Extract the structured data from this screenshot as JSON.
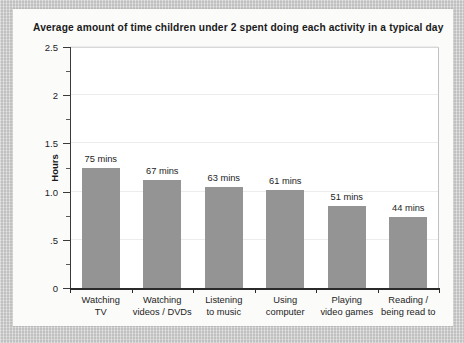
{
  "chart_data": {
    "type": "bar",
    "title": "Average amount of time children under 2 spent doing each activity in a typical day",
    "xlabel": "",
    "ylabel": "Hours",
    "categories": [
      "Watching TV",
      "Watching videos / DVDs",
      "Listening to music",
      "Using computer",
      "Playing video games",
      "Reading / being read to"
    ],
    "category_lines": [
      [
        "Watching",
        "TV"
      ],
      [
        "Watching",
        "videos / DVDs"
      ],
      [
        "Listening",
        "to music"
      ],
      [
        "Using",
        "computer"
      ],
      [
        "Playing",
        "video games"
      ],
      [
        "Reading /",
        "being read to"
      ]
    ],
    "values": [
      1.25,
      1.1167,
      1.05,
      1.0167,
      0.85,
      0.7333
    ],
    "value_labels": [
      "75 mins",
      "67 mins",
      "63 mins",
      "61 mins",
      "51 mins",
      "44 mins"
    ],
    "value_minutes": [
      75,
      67,
      63,
      61,
      51,
      44
    ],
    "ylim": [
      0,
      2.5
    ],
    "y_ticks": [
      0,
      0.5,
      1.0,
      1.5,
      2.0,
      2.5
    ],
    "y_tick_labels": [
      "0",
      ".5",
      "1.0",
      "1.5",
      "2",
      "2.5"
    ],
    "y_minor_ticks": [
      0.25,
      0.75,
      1.25,
      1.75,
      2.25
    ],
    "grid": true,
    "legend": false,
    "series_color": "#949494",
    "plot_background": "#ffffff",
    "grid_color": "#ececec",
    "axis_color": "#2b2b2b"
  },
  "page": {
    "frame_color": "#cdcdcd",
    "card_color": "#fbfbfa"
  }
}
